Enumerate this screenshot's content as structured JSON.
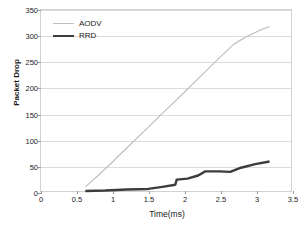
{
  "chart_data": {
    "type": "line",
    "title": "",
    "xlabel": "Time(ms)",
    "ylabel": "Packet Drop",
    "xlim": [
      0,
      3.5
    ],
    "ylim": [
      0,
      350
    ],
    "xticks": [
      "0",
      "0.5",
      "1",
      "1.5",
      "2",
      "2.5",
      "3",
      "3.5"
    ],
    "xtick_values": [
      0,
      0.5,
      1,
      1.5,
      2,
      2.5,
      3,
      3.5
    ],
    "yticks": [
      "0",
      "50",
      "100",
      "150",
      "200",
      "250",
      "300",
      "350"
    ],
    "ytick_values": [
      0,
      50,
      100,
      150,
      200,
      250,
      300,
      350
    ],
    "grid": "horizontal",
    "legend_position": "top-left-inside",
    "series": [
      {
        "name": "AODV",
        "color": "#c0c0c0",
        "line_width": 1.2,
        "x": [
          0.62,
          0.8,
          1.0,
          1.25,
          1.5,
          1.75,
          2.0,
          2.25,
          2.5,
          2.7,
          2.9,
          3.05,
          3.2
        ],
        "values": [
          8,
          30,
          56,
          90,
          123,
          157,
          190,
          224,
          258,
          284,
          300,
          310,
          318
        ]
      },
      {
        "name": "RRD",
        "color": "#3d3d3d",
        "line_width": 2.4,
        "x": [
          0.62,
          0.9,
          1.2,
          1.5,
          1.7,
          1.88,
          1.9,
          2.05,
          2.2,
          2.3,
          2.5,
          2.65,
          2.8,
          3.0,
          3.2
        ],
        "values": [
          0,
          1,
          3,
          4,
          8,
          12,
          22,
          24,
          30,
          38,
          38,
          37,
          45,
          52,
          57
        ]
      }
    ]
  },
  "legend": {
    "entries": [
      {
        "label": "AODV"
      },
      {
        "label": "RRD"
      }
    ]
  },
  "axes": {
    "x_title": "Time(ms)",
    "y_title": "Packet Drop"
  }
}
